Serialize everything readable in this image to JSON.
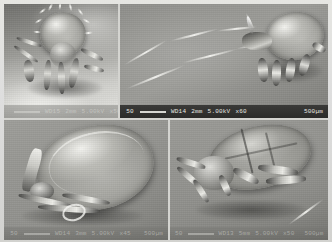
{
  "plate": {
    "title": "Scanning electron micrograph plate",
    "description": "Four-panel scanning electron microscope composite of tick / mite specimens",
    "modality": "SEM",
    "palette": "grayscale",
    "background_color": "#8b8b87",
    "frame_color": "#e2e2de",
    "layout": {
      "rows": 2,
      "columns": 2
    }
  },
  "panels": [
    {
      "id": "panel-top-left",
      "position": "top-left",
      "subject": "Tick viewed frontally, dorsal body with dense setae, legs extended onto substrate",
      "orientation": "anterior / frontal view",
      "infobar_style": "faint",
      "infobar": {
        "tick_label": "",
        "working_distance": "WD15",
        "mode": "2mm",
        "voltage": "5.00kV",
        "magnification": "x50",
        "scale_value": "500µm"
      }
    },
    {
      "id": "panel-top-right",
      "position": "top-right",
      "subject": "Tick with long slender filament / hair trailing across the stage",
      "orientation": "dorso-lateral view",
      "infobar_style": "dark",
      "infobar": {
        "tick_label": "50",
        "working_distance": "WD14",
        "mode": "2mm",
        "voltage": "5.00kV",
        "magnification": "x60",
        "scale_value": "500µm"
      }
    },
    {
      "id": "panel-bottom-left",
      "position": "bottom-left",
      "subject": "Engorged tick in lateral view showing large smooth idiosoma and mouthparts",
      "orientation": "lateral view",
      "infobar_style": "faint",
      "infobar": {
        "tick_label": "50",
        "working_distance": "WD14",
        "mode": "3mm",
        "voltage": "5.00kV",
        "magnification": "x45",
        "scale_value": "500µm"
      }
    },
    {
      "id": "panel-bottom-right",
      "position": "bottom-right",
      "subject": "Tick in lateral view with segmented dorsal shield and jointed legs",
      "orientation": "latero-ventral view",
      "infobar_style": "faint",
      "infobar": {
        "tick_label": "50",
        "working_distance": "WD13",
        "mode": "5mm",
        "voltage": "5.00kV",
        "magnification": "x50",
        "scale_value": "500µm"
      }
    }
  ]
}
